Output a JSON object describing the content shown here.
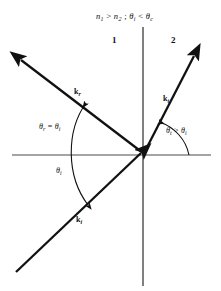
{
  "figure": {
    "title_condition": {
      "n1": "n",
      "n1_sub": "1",
      "gt": ">",
      "n2": "n",
      "n2_sub": "2",
      "sep": ";",
      "theta_i": "θ",
      "theta_i_sub": "i",
      "lt": "<",
      "theta_c": "θ",
      "theta_c_sub": "c",
      "full_text": "n1 > n2 ; θi < θc"
    },
    "regions": {
      "left_label": "1",
      "right_label": "2"
    },
    "vectors": {
      "reflected": {
        "symbol": "k",
        "subscript": "r",
        "full": "kr"
      },
      "transmitted": {
        "symbol": "k",
        "subscript": "t",
        "full": "kt"
      },
      "incident": {
        "symbol": "k",
        "subscript": "i",
        "full": "ki"
      }
    },
    "angles": {
      "reflection_relation": {
        "lhs_symbol": "θ",
        "lhs_sub": "r",
        "op": "=",
        "rhs_symbol": "θ",
        "rhs_sub": "i",
        "full": "θr = θi"
      },
      "transmission_relation": {
        "lhs_symbol": "θ",
        "lhs_sub": "t",
        "op": ">",
        "rhs_symbol": "θ",
        "rhs_sub": "i",
        "full": "θt > θi"
      },
      "incidence": {
        "symbol": "θ",
        "subscript": "i",
        "full": "θi"
      }
    },
    "colors": {
      "ink": "#111111",
      "axis": "#4a4a4a",
      "background": "#ffffff"
    }
  }
}
